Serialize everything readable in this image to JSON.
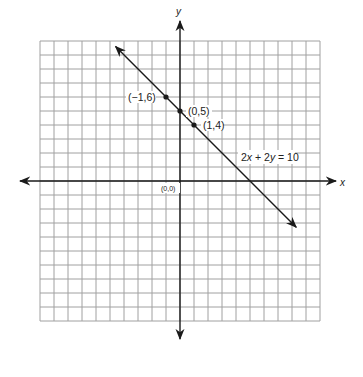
{
  "chart_data": {
    "type": "line",
    "title": "",
    "xlabel": "x",
    "ylabel": "y",
    "grid": true,
    "xlim": [
      -10,
      10
    ],
    "ylim": [
      -10,
      10
    ],
    "grid_step": 1,
    "origin_label": "(0,0)",
    "series": [
      {
        "name": "2x + 2y = 10",
        "equation": "2x + 2y = 10",
        "slope": -1,
        "intercept": 5,
        "x": [
          -4.6,
          8.3
        ],
        "y": [
          9.6,
          -3.3
        ],
        "arrows": "both"
      }
    ],
    "points": [
      {
        "label": "(−1,6)",
        "x": -1,
        "y": 6
      },
      {
        "label": "(0,5)",
        "x": 0,
        "y": 5
      },
      {
        "label": "(1,4)",
        "x": 1,
        "y": 4
      }
    ],
    "annotations": [
      {
        "text": "2x + 2y = 10",
        "parts": [
          "2",
          "x",
          " + 2",
          "y",
          " = 10"
        ]
      }
    ]
  },
  "colors": {
    "grid": "#a0a0a0",
    "axis": "#1a1a1a",
    "line": "#1a1a1a",
    "text": "#222222",
    "background": "#ffffff"
  }
}
